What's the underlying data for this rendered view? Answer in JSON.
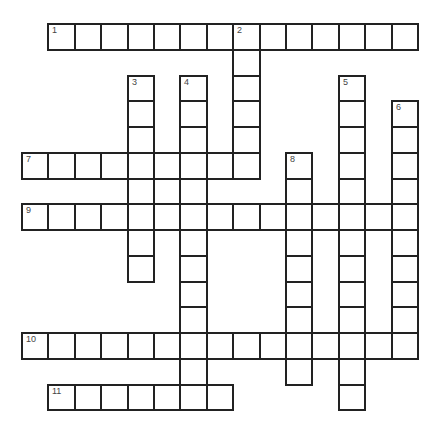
{
  "puzzle": {
    "type": "crossword",
    "grid": {
      "origin_x": 22,
      "origin_y": 24,
      "cell_w": 26.4,
      "cell_h": 25.75,
      "border_color": "#222222",
      "number_color": "#444444"
    },
    "entries": [
      {
        "number": "1",
        "direction": "across",
        "row": 0,
        "col": 1,
        "length": 14
      },
      {
        "number": "2",
        "direction": "down",
        "row": 0,
        "col": 8,
        "length": 6
      },
      {
        "number": "3",
        "direction": "down",
        "row": 2,
        "col": 4,
        "length": 8
      },
      {
        "number": "4",
        "direction": "down",
        "row": 2,
        "col": 6,
        "length": 13
      },
      {
        "number": "5",
        "direction": "down",
        "row": 2,
        "col": 12,
        "length": 13
      },
      {
        "number": "6",
        "direction": "down",
        "row": 3,
        "col": 14,
        "length": 10
      },
      {
        "number": "7",
        "direction": "across",
        "row": 5,
        "col": 0,
        "length": 9
      },
      {
        "number": "8",
        "direction": "down",
        "row": 5,
        "col": 10,
        "length": 9
      },
      {
        "number": "9",
        "direction": "across",
        "row": 7,
        "col": 0,
        "length": 15
      },
      {
        "number": "10",
        "direction": "across",
        "row": 12,
        "col": 0,
        "length": 15
      },
      {
        "number": "11",
        "direction": "across",
        "row": 14,
        "col": 1,
        "length": 7
      }
    ]
  }
}
